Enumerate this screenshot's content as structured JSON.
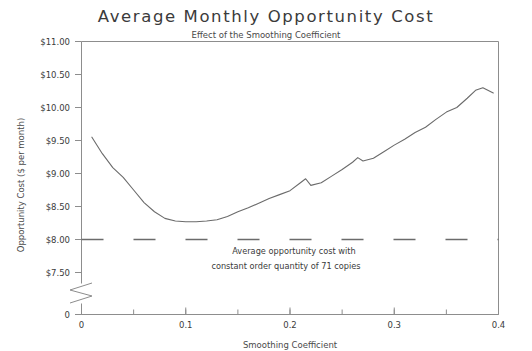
{
  "chart_data": {
    "type": "line",
    "title": "Average Monthly Opportunity Cost",
    "subtitle": "Effect of the Smoothing Coefficient",
    "xlabel": "Smoothing Coefficient",
    "ylabel": "Opportunity Cost ($ per month)",
    "xlim": [
      0,
      0.4
    ],
    "ylim": [
      7.35,
      11.0
    ],
    "grid": false,
    "legend": "none",
    "axis_break": {
      "present": true,
      "zero_label": "0",
      "note": "y-axis broken between 0 and $7.50"
    },
    "xticks": [
      0,
      0.1,
      0.2,
      0.3,
      0.4
    ],
    "xtick_labels": [
      "0",
      "0.1",
      "0.2",
      "0.3",
      "0.4"
    ],
    "xminor_step": 0.05,
    "yticks": [
      7.5,
      8.0,
      8.5,
      9.0,
      9.5,
      10.0,
      10.5,
      11.0
    ],
    "ytick_labels": [
      "$7.50",
      "$8.00",
      "$8.50",
      "$9.00",
      "$9.50",
      "$10.00",
      "$10.50",
      "$11.00"
    ],
    "series": [
      {
        "name": "Average monthly opportunity cost",
        "style": "solid",
        "color": "#6b6b6b",
        "x": [
          0.01,
          0.02,
          0.03,
          0.04,
          0.05,
          0.06,
          0.07,
          0.08,
          0.09,
          0.1,
          0.11,
          0.12,
          0.13,
          0.14,
          0.15,
          0.16,
          0.17,
          0.18,
          0.19,
          0.2,
          0.21,
          0.215,
          0.22,
          0.23,
          0.24,
          0.25,
          0.26,
          0.265,
          0.27,
          0.28,
          0.29,
          0.3,
          0.31,
          0.32,
          0.33,
          0.34,
          0.35,
          0.36,
          0.37,
          0.378,
          0.385,
          0.395
        ],
        "y": [
          9.55,
          9.3,
          9.09,
          8.94,
          8.75,
          8.56,
          8.42,
          8.32,
          8.28,
          8.27,
          8.27,
          8.28,
          8.3,
          8.35,
          8.42,
          8.48,
          8.55,
          8.62,
          8.68,
          8.74,
          8.86,
          8.92,
          8.82,
          8.86,
          8.96,
          9.06,
          9.17,
          9.24,
          9.19,
          9.23,
          9.33,
          9.43,
          9.52,
          9.62,
          9.7,
          9.82,
          9.93,
          10.0,
          10.14,
          10.26,
          10.3,
          10.22
        ]
      },
      {
        "name": "Average opportunity cost with constant order quantity of 71 copies",
        "style": "dashed",
        "color": "#6b6b6b",
        "constant_value": 8.0,
        "x": [
          0,
          0.4
        ],
        "y": [
          8.0,
          8.0
        ]
      }
    ],
    "annotations": [
      {
        "name": "reference-line-annotation",
        "line1": "Average opportunity cost with",
        "line2": "constant order quantity of 71 copies",
        "value": 8.0
      }
    ]
  }
}
